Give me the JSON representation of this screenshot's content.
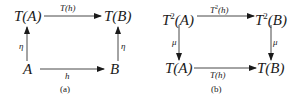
{
  "diagrams": [
    {
      "id": "a",
      "caption": "(a)",
      "nodes": {
        "top_left": {
          "base": "T",
          "sup": "",
          "arg": "(A)"
        },
        "top_right": {
          "base": "T",
          "sup": "",
          "arg": "(B)"
        },
        "bottom_left": {
          "base": "A",
          "sup": "",
          "arg": ""
        },
        "bottom_right": {
          "base": "B",
          "sup": "",
          "arg": ""
        }
      },
      "arrows": {
        "top": {
          "label": "T(h)",
          "direction": "right"
        },
        "left": {
          "label": "η",
          "direction": "up"
        },
        "right": {
          "label": "η",
          "direction": "up"
        },
        "bottom": {
          "label": "h",
          "direction": "right"
        }
      }
    },
    {
      "id": "b",
      "caption": "(b)",
      "nodes": {
        "top_left": {
          "base": "T",
          "sup": "2",
          "arg": "(A)"
        },
        "top_right": {
          "base": "T",
          "sup": "2",
          "arg": "(B)"
        },
        "bottom_left": {
          "base": "T",
          "sup": "",
          "arg": "(A)"
        },
        "bottom_right": {
          "base": "T",
          "sup": "",
          "arg": "(B)"
        }
      },
      "arrows": {
        "top": {
          "label_base": "T",
          "label_sup": "2",
          "label_arg": "(h)",
          "direction": "right"
        },
        "left": {
          "label": "μ",
          "direction": "down"
        },
        "right": {
          "label": "μ",
          "direction": "down"
        },
        "bottom": {
          "label": "T(h)",
          "direction": "right"
        }
      }
    }
  ],
  "colors": {
    "ink": "#1a1a1a",
    "background": "#ffffff"
  }
}
